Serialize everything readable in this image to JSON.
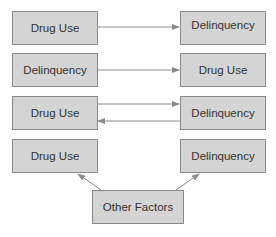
{
  "diagram": {
    "rows": [
      {
        "left": "Drug Use",
        "right": "Delinquency",
        "direction": "left-to-right"
      },
      {
        "left": "Delinquency",
        "right": "Drug Use",
        "direction": "left-to-right"
      },
      {
        "left": "Drug Use",
        "right": "Delinquency",
        "direction": "bidirectional"
      },
      {
        "left": "Drug Use",
        "right": "Delinquency",
        "direction": "none"
      }
    ],
    "common_cause": "Other Factors",
    "colors": {
      "box_fill": "#d4d4d4",
      "box_border": "#8a8a8a",
      "arrow": "#8c8c8c",
      "text": "#333333"
    }
  }
}
